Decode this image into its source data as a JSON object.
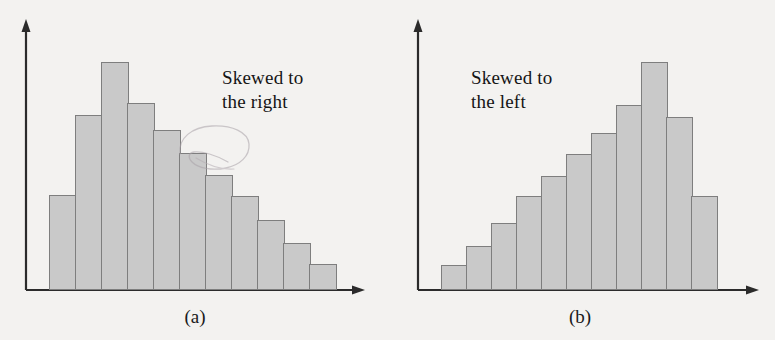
{
  "figure": {
    "background_color": "#f3f2f0",
    "bar_fill_color": "#c9c9c9",
    "bar_border_color": "#7e7e7e",
    "axis_color": "#2b2b2b"
  },
  "panels": [
    {
      "id": "a",
      "caption": "(a)",
      "annotation": "Skewed to\nthe right",
      "has_pencil_scribble": true
    },
    {
      "id": "b",
      "caption": "(b)",
      "annotation": "Skewed to\nthe left",
      "has_pencil_scribble": false
    }
  ],
  "chart_data": [
    {
      "type": "bar",
      "title": "(a)",
      "annotation": "Skewed to the right",
      "xlabel": "",
      "ylabel": "",
      "grid": false,
      "legend": "none",
      "axis_ticks": false,
      "categories": [
        "1",
        "2",
        "3",
        "4",
        "5",
        "6",
        "7",
        "8",
        "9",
        "10",
        "11"
      ],
      "values": [
        39,
        62,
        78,
        69,
        58,
        50,
        41,
        34,
        26,
        19,
        10
      ],
      "ylim": [
        0,
        100
      ],
      "bar_geometry": {
        "baseline_y": 290,
        "left_x": 49,
        "bar_width": 26,
        "tops_y": [
          195,
          115,
          62,
          103,
          130,
          153,
          175,
          196,
          220,
          243,
          264
        ]
      }
    },
    {
      "type": "bar",
      "title": "(b)",
      "annotation": "Skewed to the left",
      "xlabel": "",
      "ylabel": "",
      "grid": false,
      "legend": "none",
      "axis_ticks": false,
      "categories": [
        "1",
        "2",
        "3",
        "4",
        "5",
        "6",
        "7",
        "8",
        "9",
        "10",
        "11"
      ],
      "values": [
        10,
        19,
        29,
        41,
        50,
        58,
        68,
        80,
        98,
        74,
        41
      ],
      "ylim": [
        0,
        100
      ],
      "bar_geometry": {
        "baseline_y": 290,
        "left_x": 56,
        "bar_width": 25,
        "tops_y": [
          265,
          246,
          223,
          196,
          176,
          154,
          133,
          105,
          62,
          117,
          196
        ]
      }
    }
  ]
}
